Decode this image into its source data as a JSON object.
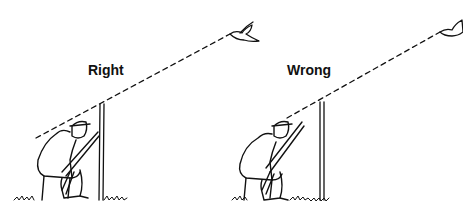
{
  "panels": [
    {
      "label": "Right",
      "description": "Hunter seated behind pole, sight line passes over top of pole to bird"
    },
    {
      "label": "Wrong",
      "description": "Hunter seated beside pole, sight line passes beside pole to bird"
    }
  ],
  "colors": {
    "ink": "#111111",
    "background": "#ffffff"
  }
}
